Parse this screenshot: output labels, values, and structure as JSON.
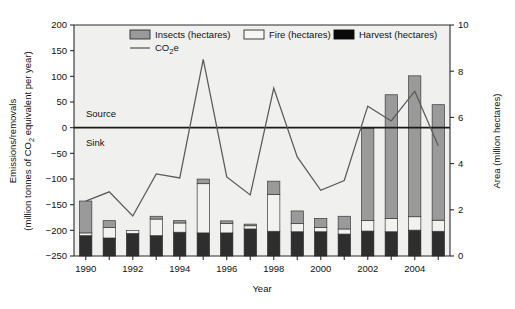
{
  "chart_data": {
    "type": "bar",
    "title": "",
    "subtitle": "",
    "xlabel": "Year",
    "ylabel": "Emissions/removals (million tonnes of CO2 equivalent per year)",
    "ylabel_line1": "Emissions/removals",
    "ylabel_line2_pre": "(million tonnes of CO",
    "ylabel_line2_sub": "2",
    "ylabel_line2_post": " equivalent per year)",
    "y2label": "Area (million hectares)",
    "ylim": [
      -250,
      200
    ],
    "y2lim": [
      0,
      10
    ],
    "yticks": [
      -250,
      -200,
      -150,
      -100,
      -50,
      0,
      50,
      100,
      150,
      200
    ],
    "ytick_labels": [
      "−250",
      "−200",
      "−150",
      "−100",
      "−50",
      "0",
      "50",
      "100",
      "150",
      "200"
    ],
    "y2ticks": [
      0,
      2,
      4,
      6,
      8,
      10
    ],
    "y2tick_labels": [
      "0",
      "2",
      "4",
      "6",
      "8",
      "10"
    ],
    "grid": false,
    "legend_position": "top-inside",
    "annotations": [
      {
        "text": "Source",
        "x_value": 1990.1,
        "y_value": 28
      },
      {
        "text": "Sink",
        "x_value": 1990.1,
        "y_value": -28
      }
    ],
    "x": [
      1990,
      1991,
      1992,
      1993,
      1994,
      1995,
      1996,
      1997,
      1998,
      1999,
      2000,
      2001,
      2002,
      2003,
      2004,
      2005
    ],
    "xtick_labels": [
      "1990",
      "",
      "1992",
      "",
      "1994",
      "",
      "1996",
      "",
      "1998",
      "",
      "2000",
      "",
      "2002",
      "",
      "2004",
      ""
    ],
    "xtick_labels_shown": [
      "1990",
      "1992",
      "1994",
      "1996",
      "1998",
      "2000",
      "2002",
      "2004"
    ],
    "bar_axis": "right",
    "bar_stacking": "stacked",
    "series": [
      {
        "name": "Harvest (hectares)",
        "color": "#2e2e2e",
        "axis": "right",
        "values": [
          0.88,
          0.78,
          0.98,
          0.88,
          1.03,
          1.0,
          1.0,
          1.17,
          1.07,
          1.05,
          1.05,
          0.95,
          1.08,
          1.05,
          1.12,
          1.07
        ]
      },
      {
        "name": "Fire (hectares)",
        "color": "#f2f2f0",
        "axis": "right",
        "values": [
          0.12,
          0.45,
          0.12,
          0.72,
          0.4,
          2.13,
          0.4,
          0.14,
          1.6,
          0.35,
          0.18,
          0.22,
          0.45,
          0.58,
          0.58,
          0.48
        ]
      },
      {
        "name": "Insects (hectares)",
        "color": "#9a9a9a",
        "axis": "right",
        "values": [
          1.38,
          0.3,
          0.0,
          0.12,
          0.1,
          0.2,
          0.12,
          0.07,
          0.57,
          0.55,
          0.4,
          0.55,
          4.0,
          5.35,
          6.1,
          5.0
        ]
      }
    ],
    "line_series": {
      "name": "CO2e",
      "label_pre": "CO",
      "label_sub": "2",
      "label_post": "e",
      "color": "#5a5a5a",
      "axis": "left",
      "values": [
        -143,
        -125,
        -172,
        -90,
        -98,
        133,
        -96,
        -131,
        77,
        -57,
        -122,
        -103,
        42,
        13,
        71,
        -35
      ]
    }
  },
  "legend": {
    "items": [
      {
        "label": "Insects (hectares)",
        "swatch": "insects-swatch"
      },
      {
        "label": "Fire (hectares)",
        "swatch": "fire-swatch"
      },
      {
        "label": "Harvest (hectares)",
        "swatch": "harvest-swatch"
      }
    ],
    "line_item": {
      "label_pre": "CO",
      "label_sub": "2",
      "label_post": "e",
      "swatch": "co2e-line-swatch"
    }
  }
}
